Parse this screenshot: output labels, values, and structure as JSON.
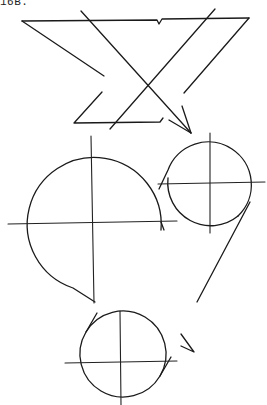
{
  "figure": {
    "label": "16B.",
    "stroke_color": "#1a1a1a",
    "background": "#ffffff"
  },
  "shapes": {
    "zigzag": {
      "top_line": [
        [
          22,
          21
        ],
        [
          157,
          20
        ],
        [
          159,
          24
        ],
        [
          162,
          19
        ],
        [
          249,
          18
        ]
      ],
      "upper_diagonal": [
        [
          22,
          21
        ],
        [
          104,
          76
        ]
      ],
      "lower_diagonal": [
        [
          102,
          92
        ],
        [
          74,
          123
        ],
        [
          160,
          122
        ],
        [
          163,
          118
        ]
      ],
      "right_diagonal": [
        [
          249,
          18
        ],
        [
          184,
          93
        ]
      ]
    },
    "crossing_lines": {
      "rising": [
        [
          215,
          9
        ],
        [
          110,
          129
        ]
      ],
      "falling": [
        [
          81,
          11
        ],
        [
          191,
          133
        ]
      ],
      "arrow_barbs": [
        [
          [
            182,
            106
          ],
          [
            191,
            133
          ]
        ],
        [
          [
            169,
            120
          ],
          [
            191,
            133
          ]
        ]
      ]
    },
    "circles": [
      {
        "name": "large",
        "cx": 92,
        "cy": 222,
        "r": 67
      },
      {
        "name": "upper-right",
        "cx": 209,
        "cy": 184,
        "r": 43
      },
      {
        "name": "bottom",
        "cx": 120,
        "cy": 361,
        "r": 42
      }
    ],
    "long_stroke": [
      [
        250,
        202
      ],
      [
        197,
        302
      ]
    ],
    "check_mark": [
      [
        181,
        334
      ],
      [
        194,
        352
      ],
      [
        181,
        346
      ]
    ]
  }
}
